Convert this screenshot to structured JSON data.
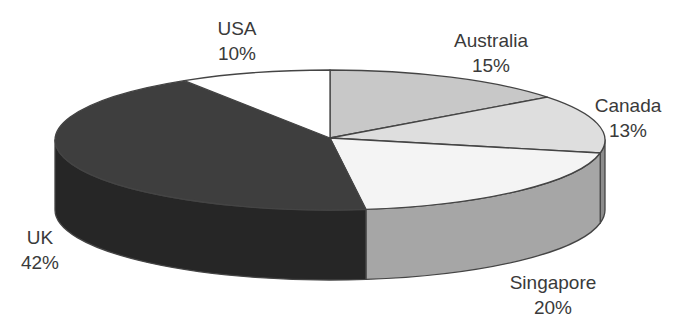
{
  "chart_data": {
    "type": "pie",
    "style": "3d",
    "title": "",
    "slices": [
      {
        "label": "Australia",
        "value": 15,
        "display": "15%",
        "top_color": "#c8c8c8",
        "side_color": "#a8a8a8",
        "start_deg": -90,
        "end_deg": -37.8,
        "label_x": 491,
        "label_y": 28
      },
      {
        "label": "Canada",
        "value": 13,
        "display": "13%",
        "top_color": "#dedede",
        "side_color": "#8c8c8c",
        "start_deg": -37.8,
        "end_deg": 10.7,
        "label_x": 628,
        "label_y": 93
      },
      {
        "label": "Singapore",
        "value": 20,
        "display": "20%",
        "top_color": "#f4f4f4",
        "side_color": "#a6a6a6",
        "start_deg": 10.7,
        "end_deg": 82.5,
        "label_x": 553,
        "label_y": 270
      },
      {
        "label": "UK",
        "value": 42,
        "display": "42%",
        "top_color": "#3e3e3e",
        "side_color": "#262626",
        "start_deg": 82.5,
        "end_deg": 238,
        "label_x": 40,
        "label_y": 225
      },
      {
        "label": "USA",
        "value": 10,
        "display": "10%",
        "top_color": "#ffffff",
        "side_color": "#e0e0e0",
        "start_deg": 238,
        "end_deg": 270,
        "label_x": 237,
        "label_y": 16
      }
    ],
    "geometry": {
      "cx": 330,
      "cy": 140,
      "rx": 275,
      "ry": 70,
      "depth": 70,
      "apex_x": 330,
      "apex_y": 138
    },
    "legend": "none",
    "outline_color": "#444444"
  }
}
